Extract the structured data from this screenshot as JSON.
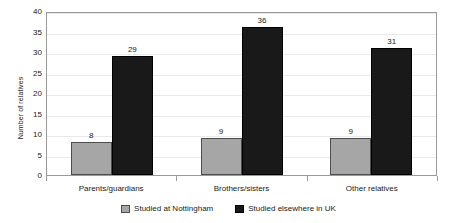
{
  "chart_data": {
    "type": "bar",
    "title": "",
    "subtitle": "",
    "xlabel": "",
    "ylabel": "Number of relatives",
    "categories": [
      "Parents/guardians",
      "Brothers/sisters",
      "Other relatives"
    ],
    "series": [
      {
        "name": "Studied at Nottingham",
        "color": "#a6a6a6",
        "border_color": "#4d4d4d",
        "values": [
          8,
          9,
          9
        ]
      },
      {
        "name": "Studied elsewhere in UK",
        "color": "#191919",
        "border_color": "#000000",
        "values": [
          29,
          36,
          31
        ]
      }
    ],
    "ylim": [
      0,
      40
    ],
    "ytick_step": 5,
    "ytick_labels": [
      "40",
      "35",
      "30",
      "25",
      "20",
      "15",
      "10",
      "5",
      "0"
    ],
    "grid": true,
    "grid_axis": "y",
    "grid_color": "#e9e9e9",
    "legend_position": "bottom",
    "data_labels": true,
    "plot_border_color": "#9a9a9a",
    "background_color": "#ffffff",
    "text_color": "#1a1a1a"
  },
  "axis": {
    "y_title": "Number of relatives",
    "ticks": [
      {
        "label": "40",
        "value": 40
      },
      {
        "label": "35",
        "value": 35
      },
      {
        "label": "30",
        "value": 30
      },
      {
        "label": "25",
        "value": 25
      },
      {
        "label": "20",
        "value": 20
      },
      {
        "label": "15",
        "value": 15
      },
      {
        "label": "10",
        "value": 10
      },
      {
        "label": "5",
        "value": 5
      },
      {
        "label": "0",
        "value": 0
      }
    ]
  },
  "categories": [
    {
      "label": "Parents/guardians",
      "bars": [
        {
          "series": "Studied at Nottingham",
          "value": 8,
          "label": "8"
        },
        {
          "series": "Studied elsewhere in UK",
          "value": 29,
          "label": "29"
        }
      ]
    },
    {
      "label": "Brothers/sisters",
      "bars": [
        {
          "series": "Studied at Nottingham",
          "value": 9,
          "label": "9"
        },
        {
          "series": "Studied elsewhere in UK",
          "value": 36,
          "label": "36"
        }
      ]
    },
    {
      "label": "Other relatives",
      "bars": [
        {
          "series": "Studied at Nottingham",
          "value": 9,
          "label": "9"
        },
        {
          "series": "Studied elsewhere in UK",
          "value": 31,
          "label": "31"
        }
      ]
    }
  ],
  "legend": {
    "items": [
      {
        "label": "Studied at Nottingham",
        "color": "#a6a6a6"
      },
      {
        "label": "Studied elsewhere in UK",
        "color": "#191919"
      }
    ]
  }
}
